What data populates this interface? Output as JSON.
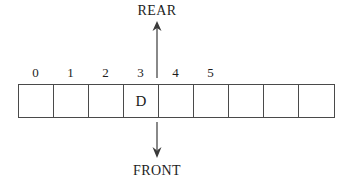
{
  "diagram": {
    "type": "queue-array-diagram",
    "title": "",
    "pointers": {
      "rear": {
        "label": "REAR",
        "index": 3,
        "direction": "up"
      },
      "front": {
        "label": "FRONT",
        "index": 3,
        "direction": "down"
      }
    },
    "index_labels": [
      "0",
      "1",
      "2",
      "3",
      "4",
      "5"
    ],
    "cells": [
      {
        "index": 0,
        "value": ""
      },
      {
        "index": 1,
        "value": ""
      },
      {
        "index": 2,
        "value": ""
      },
      {
        "index": 3,
        "value": "D"
      },
      {
        "index": 4,
        "value": ""
      },
      {
        "index": 5,
        "value": ""
      },
      {
        "index": 6,
        "value": ""
      },
      {
        "index": 7,
        "value": ""
      },
      {
        "index": 8,
        "value": ""
      }
    ],
    "colors": {
      "stroke": "#4a4a4a",
      "text": "#1a1a1a",
      "background": "#ffffff",
      "arrow": "#3a3a3a"
    }
  }
}
